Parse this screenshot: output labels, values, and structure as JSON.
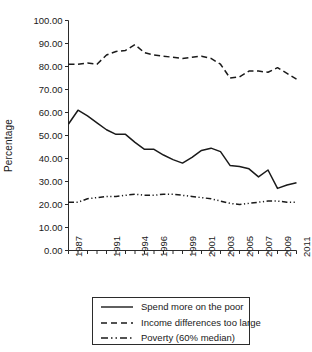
{
  "chart_data": {
    "type": "line",
    "title": "",
    "xlabel": "",
    "ylabel": "Percentage",
    "ylim": [
      0,
      100
    ],
    "ystep": 10,
    "ytick_labels": [
      "0.00",
      "10.00",
      "20.00",
      "30.00",
      "40.00",
      "50.00",
      "60.00",
      "70.00",
      "80.00",
      "90.00",
      "100.00"
    ],
    "ytick_values": [
      0,
      10,
      20,
      30,
      40,
      50,
      60,
      70,
      80,
      90,
      100
    ],
    "grid": false,
    "legend_position": "below",
    "x": [
      1987,
      1988,
      1989,
      1990,
      1991,
      1992,
      1993,
      1994,
      1995,
      1996,
      1997,
      1998,
      1999,
      2000,
      2001,
      2002,
      2003,
      2004,
      2005,
      2006,
      2007,
      2008,
      2009,
      2010,
      2011
    ],
    "xlim": [
      1987,
      2011
    ],
    "xtick_labels": [
      "1987",
      "1991",
      "1994",
      "1996",
      "1999",
      "2001",
      "2003",
      "2005",
      "2007",
      "2009",
      "2011"
    ],
    "xtick_values": [
      1987,
      1991,
      1994,
      1996,
      1999,
      2001,
      2003,
      2005,
      2007,
      2009,
      2011
    ],
    "series": [
      {
        "name": "Spend more on the poor",
        "style": "solid",
        "values": [
          55.0,
          61.0,
          58.5,
          55.5,
          52.5,
          50.5,
          50.5,
          47.0,
          44.0,
          44.0,
          41.5,
          39.5,
          38.0,
          40.5,
          43.5,
          44.5,
          43.0,
          37.0,
          36.5,
          35.5,
          32.0,
          35.0,
          27.0,
          28.5,
          29.5
        ]
      },
      {
        "name": "Income differences too large",
        "style": "dashed",
        "values": [
          81.0,
          81.0,
          81.5,
          81.0,
          85.0,
          86.5,
          87.0,
          89.5,
          86.0,
          85.0,
          84.5,
          84.0,
          83.5,
          84.0,
          84.5,
          83.5,
          81.0,
          75.0,
          75.5,
          78.0,
          78.0,
          77.5,
          79.5,
          77.0,
          74.5
        ]
      },
      {
        "name": "Poverty (60% median)",
        "style": "dashdot",
        "values": [
          21.0,
          21.0,
          22.5,
          23.0,
          23.5,
          23.5,
          24.0,
          24.5,
          24.0,
          24.0,
          24.5,
          24.5,
          24.0,
          23.5,
          23.0,
          22.5,
          21.5,
          20.5,
          20.0,
          20.5,
          21.0,
          21.5,
          21.5,
          21.0,
          21.0
        ]
      }
    ]
  },
  "figure": {
    "axis_color": "#2b2b2b",
    "line_color": "#1a1a1a",
    "background": "#ffffff"
  },
  "legend": {
    "items": [
      {
        "label": "Spend more on the poor",
        "style": "solid"
      },
      {
        "label": "Income differences too large",
        "style": "dashed"
      },
      {
        "label": "Poverty (60% median)",
        "style": "dashdot"
      }
    ]
  }
}
